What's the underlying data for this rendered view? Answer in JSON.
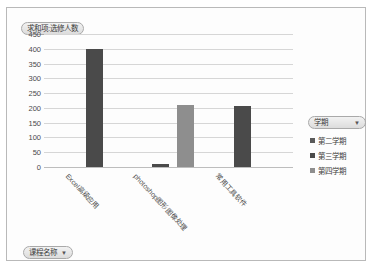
{
  "chart_data": {
    "type": "bar",
    "title": "求和项:选修人数",
    "xlabel": "课程名称",
    "ylabel": "",
    "ylim": [
      0,
      450
    ],
    "yticks": [
      450,
      400,
      350,
      300,
      250,
      200,
      150,
      100,
      50,
      0
    ],
    "grid": true,
    "legend_position": "right",
    "categories": [
      "Excel高级应用",
      "photoshop图形图像处理",
      "常用工具软件"
    ],
    "series": [
      {
        "name": "第二学期",
        "color": "#4a4a4a",
        "values": [
          400,
          null,
          null
        ]
      },
      {
        "name": "第三学期",
        "color": "#4a4a4a",
        "values": [
          null,
          10,
          205
        ]
      },
      {
        "name": "第四学期",
        "color": "#8e8e8e",
        "values": [
          null,
          210,
          null
        ]
      }
    ],
    "bars": [
      {
        "category": "Excel高级应用",
        "series": "第二学期",
        "value": 400,
        "color": "#4a4a4a",
        "x_pct": 17.0,
        "width_pct": 6.8
      },
      {
        "category": "photoshop图形图像处理",
        "series": "第三学期",
        "value": 10,
        "color": "#4a4a4a",
        "x_pct": 43.5,
        "width_pct": 6.8
      },
      {
        "category": "photoshop图形图像处理",
        "series": "第四学期",
        "value": 210,
        "color": "#8e8e8e",
        "x_pct": 53.5,
        "width_pct": 6.8
      },
      {
        "category": "常用工具软件",
        "series": "第三学期",
        "value": 205,
        "color": "#4a4a4a",
        "x_pct": 76.5,
        "width_pct": 6.8
      }
    ]
  },
  "pivot_chart": {
    "value_field_button": {
      "label": "求和项:选修人数",
      "caret": "▼",
      "has_caret": false
    },
    "legend_field_button": {
      "label": "学期",
      "caret": "▼"
    },
    "category_field_button": {
      "label": "课程名称",
      "caret": "▼"
    }
  },
  "legend": {
    "items": [
      {
        "label": "第二学期",
        "color": "#5a5a5a"
      },
      {
        "label": "第三学期",
        "color": "#4a4a4a"
      },
      {
        "label": "第四学期",
        "color": "#8e8e8e"
      }
    ]
  },
  "x_labels": [
    {
      "text": "Excel高级应用",
      "left_pct": 11
    },
    {
      "text": "photoshop图形图像处理",
      "left_pct": 38
    },
    {
      "text": "常用工具软件",
      "left_pct": 71
    }
  ]
}
